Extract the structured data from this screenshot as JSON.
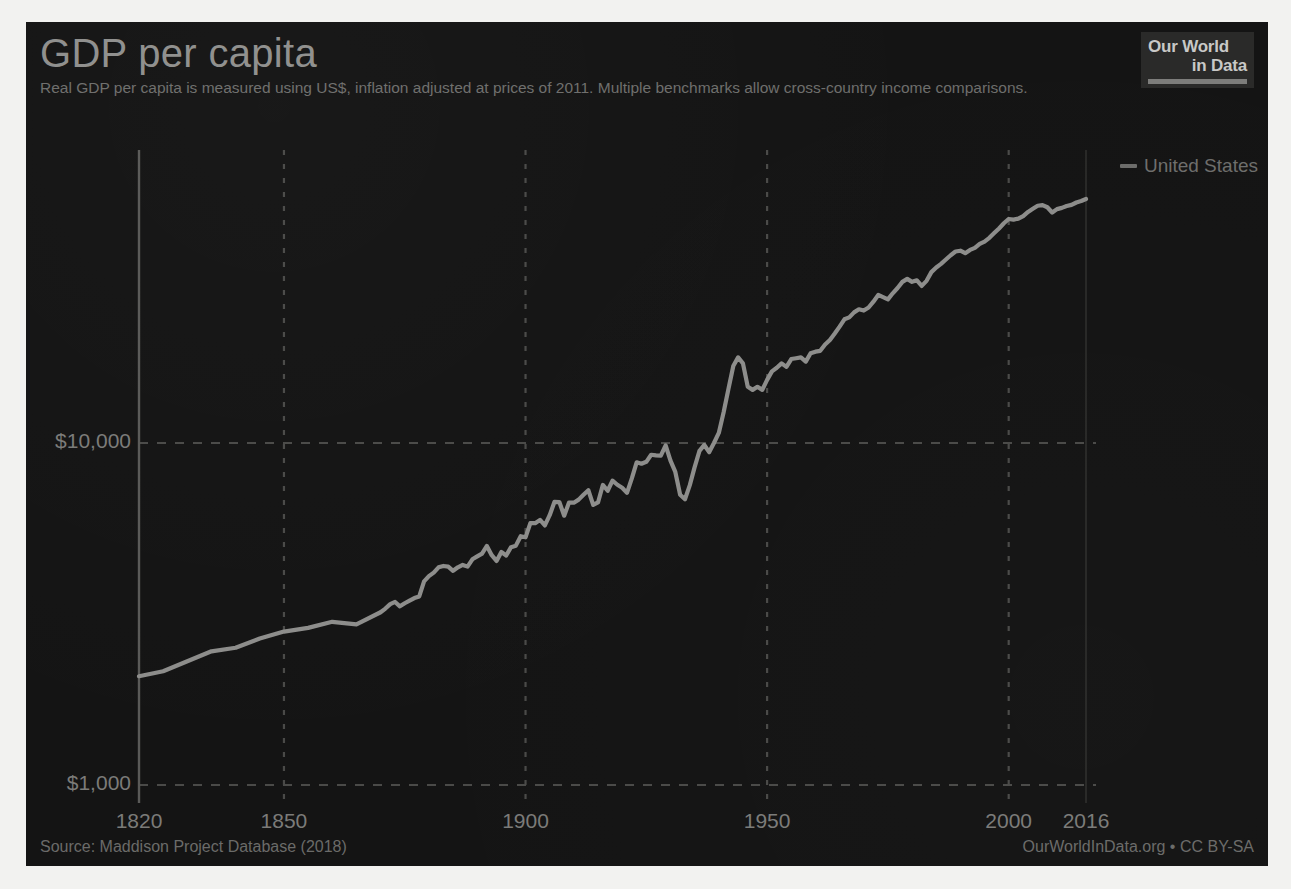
{
  "header": {
    "title": "GDP per capita",
    "subtitle": "Real GDP per capita is measured using US$, inflation adjusted at prices of 2011. Multiple benchmarks allow cross-country income comparisons."
  },
  "logo": {
    "line1": "Our World",
    "line2": "in Data"
  },
  "footer": {
    "source": "Source: Maddison Project Database (2018)",
    "attribution": "OurWorldInData.org • CC BY-SA"
  },
  "colors": {
    "panel_background": "#141414",
    "series_line": "#8d8d8b",
    "grid": "#4a4a48",
    "axis": "#5a5a58",
    "text": "#7b7b79",
    "title_text": "#8f8f8d"
  },
  "chart_data": {
    "type": "line",
    "title": "GDP per capita",
    "subtitle": "Real GDP per capita is measured using US$, inflation adjusted at prices of 2011. Multiple benchmarks allow cross-country income comparisons.",
    "xlabel": "",
    "ylabel": "",
    "yscale": "log",
    "ylim": [
      1000,
      70000
    ],
    "xlim": [
      1820,
      2016
    ],
    "grid": true,
    "legend_position": "right",
    "y_ticks": [
      1000,
      10000
    ],
    "y_tick_labels": [
      "$1,000",
      "$10,000"
    ],
    "x_ticks": [
      1820,
      1850,
      1900,
      1950,
      2000,
      2016
    ],
    "x_tick_labels": [
      "1820",
      "1850",
      "1900",
      "1950",
      "2000",
      "2016"
    ],
    "series": [
      {
        "name": "United States",
        "color": "#8d8d8b",
        "x": [
          1820,
          1825,
          1830,
          1835,
          1840,
          1845,
          1850,
          1855,
          1860,
          1865,
          1870,
          1871,
          1872,
          1873,
          1874,
          1875,
          1876,
          1877,
          1878,
          1879,
          1880,
          1881,
          1882,
          1883,
          1884,
          1885,
          1886,
          1887,
          1888,
          1889,
          1890,
          1891,
          1892,
          1893,
          1894,
          1895,
          1896,
          1897,
          1898,
          1899,
          1900,
          1901,
          1902,
          1903,
          1904,
          1905,
          1906,
          1907,
          1908,
          1909,
          1910,
          1911,
          1912,
          1913,
          1914,
          1915,
          1916,
          1917,
          1918,
          1919,
          1920,
          1921,
          1922,
          1923,
          1924,
          1925,
          1926,
          1927,
          1928,
          1929,
          1930,
          1931,
          1932,
          1933,
          1934,
          1935,
          1936,
          1937,
          1938,
          1939,
          1940,
          1941,
          1942,
          1943,
          1944,
          1945,
          1946,
          1947,
          1948,
          1949,
          1950,
          1951,
          1952,
          1953,
          1954,
          1955,
          1956,
          1957,
          1958,
          1959,
          1960,
          1961,
          1962,
          1963,
          1964,
          1965,
          1966,
          1967,
          1968,
          1969,
          1970,
          1971,
          1972,
          1973,
          1974,
          1975,
          1976,
          1977,
          1978,
          1979,
          1980,
          1981,
          1982,
          1983,
          1984,
          1985,
          1986,
          1987,
          1988,
          1989,
          1990,
          1991,
          1992,
          1993,
          1994,
          1995,
          1996,
          1997,
          1998,
          1999,
          2000,
          2001,
          2002,
          2003,
          2004,
          2005,
          2006,
          2007,
          2008,
          2009,
          2010,
          2011,
          2012,
          2013,
          2014,
          2015,
          2016
        ],
        "y": [
          2080,
          2150,
          2300,
          2460,
          2520,
          2680,
          2810,
          2880,
          3000,
          2950,
          3200,
          3280,
          3380,
          3430,
          3330,
          3400,
          3460,
          3520,
          3560,
          3940,
          4080,
          4180,
          4330,
          4370,
          4350,
          4230,
          4330,
          4400,
          4350,
          4570,
          4660,
          4750,
          5000,
          4700,
          4520,
          4800,
          4690,
          4960,
          5010,
          5340,
          5300,
          5830,
          5830,
          5960,
          5740,
          6150,
          6730,
          6720,
          6130,
          6700,
          6690,
          6830,
          7060,
          7280,
          6590,
          6700,
          7540,
          7250,
          7760,
          7550,
          7400,
          7150,
          7880,
          8780,
          8700,
          8810,
          9240,
          9200,
          9180,
          9840,
          8880,
          8230,
          7060,
          6850,
          7530,
          8500,
          9490,
          9870,
          9400,
          10000,
          10700,
          12300,
          14400,
          16800,
          17800,
          17100,
          14600,
          14300,
          14600,
          14300,
          15300,
          16200,
          16600,
          17100,
          16700,
          17600,
          17700,
          17800,
          17300,
          18300,
          18500,
          18600,
          19400,
          20000,
          20900,
          21900,
          23000,
          23300,
          24100,
          24600,
          24400,
          24900,
          25900,
          27100,
          26700,
          26300,
          27400,
          28400,
          29600,
          30200,
          29600,
          29900,
          28800,
          29800,
          31600,
          32600,
          33400,
          34400,
          35400,
          36300,
          36500,
          35900,
          36700,
          37200,
          38200,
          38800,
          39800,
          41100,
          42400,
          43900,
          45200,
          45000,
          45300,
          46100,
          47400,
          48400,
          49400,
          49600,
          48900,
          47200,
          48300,
          48700,
          49300,
          49700,
          50500,
          51000,
          51700
        ]
      }
    ]
  }
}
